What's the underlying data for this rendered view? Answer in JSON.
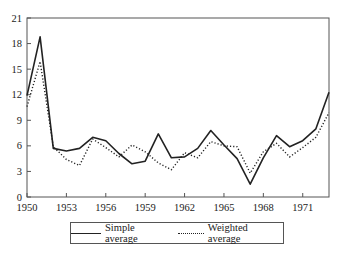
{
  "chart_data": {
    "type": "line",
    "title": "",
    "xlabel": "",
    "ylabel": "",
    "x": [
      1950,
      1951,
      1952,
      1953,
      1954,
      1955,
      1956,
      1957,
      1958,
      1959,
      1960,
      1961,
      1962,
      1963,
      1964,
      1965,
      1966,
      1967,
      1968,
      1969,
      1970,
      1971,
      1972,
      1973
    ],
    "series": [
      {
        "name": "Simple average",
        "style": "solid",
        "values": [
          11.9,
          18.8,
          5.7,
          5.4,
          5.7,
          7.0,
          6.6,
          5.1,
          3.9,
          4.2,
          7.4,
          4.6,
          4.7,
          5.7,
          7.8,
          6.1,
          4.5,
          1.5,
          4.6,
          7.2,
          5.9,
          6.6,
          8.0,
          12.3
        ]
      },
      {
        "name": "Weighted average",
        "style": "dotted",
        "values": [
          10.6,
          15.9,
          5.9,
          4.4,
          3.7,
          6.8,
          5.8,
          4.7,
          6.1,
          5.3,
          4.0,
          3.2,
          5.2,
          4.6,
          6.5,
          6.0,
          5.9,
          2.8,
          5.3,
          6.3,
          4.7,
          5.8,
          7.0,
          9.9
        ]
      }
    ],
    "xticks": [
      1950,
      1953,
      1956,
      1959,
      1962,
      1965,
      1968,
      1971
    ],
    "yticks": [
      0,
      3,
      6,
      9,
      12,
      15,
      18,
      21
    ],
    "xlim": [
      1950,
      1973
    ],
    "ylim": [
      0,
      21
    ],
    "grid": false,
    "legend_position": "bottom"
  },
  "legend": {
    "simple_label": "Simple average",
    "weighted_label": "Weighted average"
  }
}
